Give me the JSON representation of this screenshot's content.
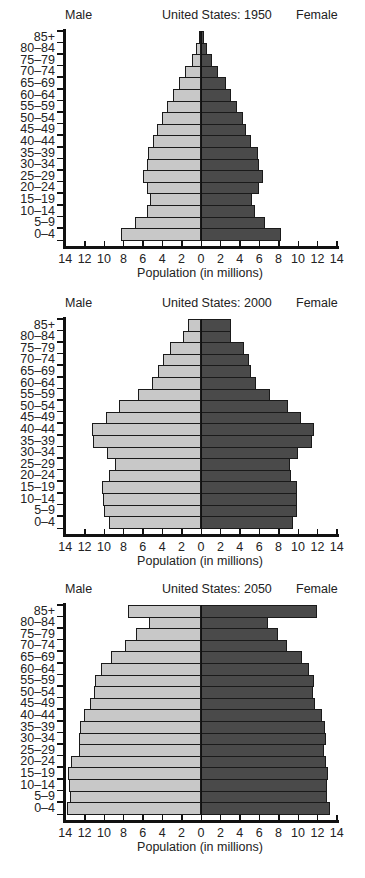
{
  "colors": {
    "male": "#c8c8c8",
    "female": "#4a4a4a",
    "outline": "#1a1a1a"
  },
  "chart_data": [
    {
      "type": "bar",
      "orientation": "horizontal-pyramid",
      "title": "United States: 1950",
      "left_label": "Male",
      "right_label": "Female",
      "xlabel": "Population (in millions)",
      "xticks": [
        "14",
        "12",
        "10",
        "8",
        "6",
        "4",
        "2",
        "0",
        "2",
        "4",
        "6",
        "8",
        "10",
        "12",
        "14"
      ],
      "xlim": [
        -14,
        14
      ],
      "categories": [
        "85+",
        "80-84",
        "75-79",
        "70-74",
        "65-69",
        "60-64",
        "55-59",
        "50-54",
        "45-49",
        "40-44",
        "35-39",
        "30-34",
        "25-29",
        "20-24",
        "15-19",
        "10-14",
        "5-9",
        "0-4"
      ],
      "series": [
        {
          "name": "Male",
          "values": [
            0.2,
            0.5,
            0.9,
            1.6,
            2.3,
            2.9,
            3.5,
            4.0,
            4.5,
            5.0,
            5.5,
            5.6,
            6.0,
            5.6,
            5.3,
            5.6,
            6.8,
            8.2
          ]
        },
        {
          "name": "Female",
          "values": [
            0.3,
            0.6,
            1.1,
            1.8,
            2.6,
            3.1,
            3.7,
            4.3,
            4.6,
            5.2,
            5.9,
            6.0,
            6.4,
            6.0,
            5.3,
            5.6,
            6.6,
            8.2
          ]
        }
      ]
    },
    {
      "type": "bar",
      "orientation": "horizontal-pyramid",
      "title": "United States: 2000",
      "left_label": "Male",
      "right_label": "Female",
      "xlabel": "Population (in millions)",
      "xticks": [
        "14",
        "12",
        "10",
        "8",
        "6",
        "4",
        "2",
        "0",
        "2",
        "4",
        "6",
        "8",
        "10",
        "12",
        "14"
      ],
      "xlim": [
        -14,
        14
      ],
      "categories": [
        "85+",
        "80-84",
        "75-79",
        "70-74",
        "65-69",
        "60-64",
        "55-59",
        "50-54",
        "45-49",
        "40-44",
        "35-39",
        "30-34",
        "25-29",
        "20-24",
        "15-19",
        "10-14",
        "5-9",
        "0-4"
      ],
      "series": [
        {
          "name": "Male",
          "values": [
            1.3,
            1.9,
            3.2,
            3.9,
            4.4,
            5.1,
            6.5,
            8.5,
            9.8,
            11.2,
            11.1,
            9.7,
            8.9,
            9.5,
            10.2,
            10.1,
            10.0,
            9.5
          ]
        },
        {
          "name": "Female",
          "values": [
            3.1,
            3.1,
            4.4,
            4.9,
            5.2,
            5.7,
            7.1,
            9.0,
            10.3,
            11.6,
            11.4,
            10.0,
            9.2,
            9.3,
            9.9,
            9.9,
            9.9,
            9.5
          ]
        }
      ]
    },
    {
      "type": "bar",
      "orientation": "horizontal-pyramid",
      "title": "United States: 2050",
      "left_label": "Male",
      "right_label": "Female",
      "xlabel": "Population (in millions)",
      "xticks": [
        "14",
        "12",
        "10",
        "8",
        "6",
        "4",
        "2",
        "0",
        "2",
        "4",
        "6",
        "8",
        "10",
        "12",
        "14"
      ],
      "xlim": [
        -14,
        14
      ],
      "categories": [
        "85+",
        "80-84",
        "75-79",
        "70-74",
        "65-69",
        "60-64",
        "55-59",
        "50-54",
        "45-49",
        "40-44",
        "35-39",
        "30-34",
        "25-29",
        "20-24",
        "15-19",
        "10-14",
        "5-9",
        "0-4"
      ],
      "series": [
        {
          "name": "Male",
          "values": [
            7.5,
            5.4,
            6.7,
            7.8,
            9.3,
            10.3,
            10.9,
            11.0,
            11.4,
            12.1,
            12.5,
            12.6,
            12.6,
            13.4,
            13.7,
            13.6,
            13.5,
            13.8
          ]
        },
        {
          "name": "Female",
          "values": [
            12.0,
            6.9,
            7.9,
            8.9,
            10.4,
            11.1,
            11.7,
            11.5,
            11.8,
            12.5,
            12.8,
            12.9,
            12.7,
            12.9,
            13.1,
            13.0,
            13.0,
            13.3
          ]
        }
      ]
    }
  ]
}
